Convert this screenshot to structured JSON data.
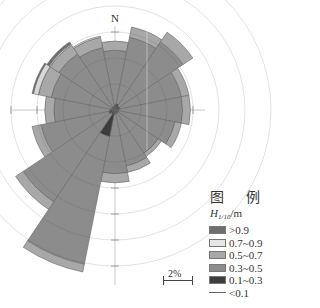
{
  "chart_data": {
    "type": "rose",
    "title": "",
    "north_label": "N",
    "center_px": [
      115,
      110
    ],
    "px_per_percent": 13,
    "ring_step_percent": 2,
    "directions": [
      "N",
      "NNE",
      "NE",
      "ENE",
      "E",
      "ESE",
      "SE",
      "SSE",
      "S",
      "SSW",
      "SW",
      "WSW",
      "W",
      "WNW",
      "NW",
      "NNW"
    ],
    "series": [
      {
        "name": "<0.1",
        "color": "#555555",
        "values": [
          0.1,
          0.1,
          0.1,
          0.1,
          0.1,
          0.1,
          0.1,
          0.1,
          0.1,
          0.1,
          0.1,
          0.1,
          0.1,
          0.1,
          0.1,
          0.1
        ]
      },
      {
        "name": "0.1~0.3",
        "color": "#3d3d3d",
        "values": [
          0.3,
          0.4,
          0.3,
          0.3,
          0.2,
          0.2,
          0.2,
          0.2,
          0.2,
          2.0,
          0.3,
          0.4,
          0.3,
          0.2,
          0.2,
          0.2
        ]
      },
      {
        "name": "0.3~0.5",
        "color": "#8c8c8c",
        "values": [
          4.2,
          5.2,
          5.9,
          4.8,
          4.9,
          4.4,
          3.7,
          4.1,
          4.6,
          10.0,
          8.1,
          5.3,
          4.3,
          4.7,
          4.9,
          4.6
        ]
      },
      {
        "name": "0.5~0.7",
        "color": "#a8a8a8",
        "values": [
          0.7,
          0.8,
          0.9,
          0.6,
          0.6,
          0.5,
          0.3,
          0.5,
          0.7,
          0.6,
          0.7,
          0.7,
          0.7,
          1.0,
          0.8,
          0.8
        ]
      },
      {
        "name": "0.7~0.9",
        "color": "#d8d8d8",
        "values": [
          0.0,
          0.0,
          0.0,
          0.0,
          0.0,
          0.0,
          0.0,
          0.0,
          0.0,
          0.0,
          0.0,
          0.0,
          0.0,
          0.4,
          0.1,
          0.1
        ]
      },
      {
        "name": ">0.9",
        "color": "#6e6e6e",
        "values": [
          0.0,
          0.0,
          0.0,
          0.0,
          0.0,
          0.0,
          0.0,
          0.0,
          0.0,
          0.0,
          0.0,
          0.0,
          0.0,
          0.1,
          0.2,
          0.0
        ]
      }
    ],
    "totals_percent": [
      5.3,
      6.5,
      7.2,
      5.8,
      5.8,
      5.2,
      4.4,
      4.9,
      5.6,
      12.7,
      9.2,
      6.5,
      5.4,
      6.5,
      6.3,
      5.8
    ],
    "legend_position": "lower-right",
    "scale_bar": "2%"
  },
  "legend": {
    "title": "图 例",
    "unit_var": "H",
    "unit_sub": "1/10",
    "unit_suffix": "/m",
    "items": [
      {
        "label": ">0.9",
        "color": "#6e6e6e"
      },
      {
        "label": "0.7~0.9",
        "color": "#e6e6e6"
      },
      {
        "label": "0.5~0.7",
        "color": "#a8a8a8"
      },
      {
        "label": "0.3~0.5",
        "color": "#8c8c8c"
      },
      {
        "label": "0.1~0.3",
        "color": "#3d3d3d"
      },
      {
        "label": "<0.1",
        "color": "line"
      }
    ]
  },
  "scale_bar": {
    "label": "2%"
  }
}
